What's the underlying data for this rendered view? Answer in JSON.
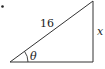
{
  "diagram": {
    "type": "right-triangle",
    "hypotenuse_label": "16",
    "opposite_label": "x",
    "angle_label": "θ",
    "bullet": "•",
    "stroke_color": "#333333"
  }
}
